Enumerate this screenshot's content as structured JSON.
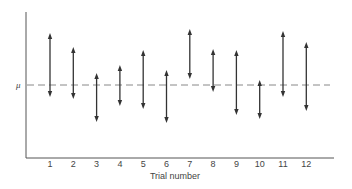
{
  "chart_data": {
    "type": "interval",
    "title": "",
    "xlabel": "Trial number",
    "ylabel": "",
    "reference_line": {
      "label": "μ",
      "style": "dashed",
      "y_pixel": 85
    },
    "categories": [
      "1",
      "2",
      "3",
      "4",
      "5",
      "6",
      "7",
      "8",
      "9",
      "10",
      "11",
      "12"
    ],
    "intervals": [
      {
        "trial": 1,
        "top": 33,
        "bottom": 97
      },
      {
        "trial": 2,
        "top": 47,
        "bottom": 99
      },
      {
        "trial": 3,
        "top": 73,
        "bottom": 122
      },
      {
        "trial": 4,
        "top": 65,
        "bottom": 106
      },
      {
        "trial": 5,
        "top": 50,
        "bottom": 109
      },
      {
        "trial": 6,
        "top": 70,
        "bottom": 123
      },
      {
        "trial": 7,
        "top": 29,
        "bottom": 79
      },
      {
        "trial": 8,
        "top": 49,
        "bottom": 92
      },
      {
        "trial": 9,
        "top": 50,
        "bottom": 115
      },
      {
        "trial": 10,
        "top": 80,
        "bottom": 119
      },
      {
        "trial": 11,
        "top": 31,
        "bottom": 97
      },
      {
        "trial": 12,
        "top": 42,
        "bottom": 111
      }
    ],
    "contains_mu": [
      true,
      true,
      true,
      true,
      true,
      true,
      false,
      true,
      true,
      true,
      true,
      true
    ],
    "grid": false,
    "legend": null,
    "colors": {
      "axis": "#555555",
      "arrow": "#333333",
      "reference": "#888888"
    }
  }
}
